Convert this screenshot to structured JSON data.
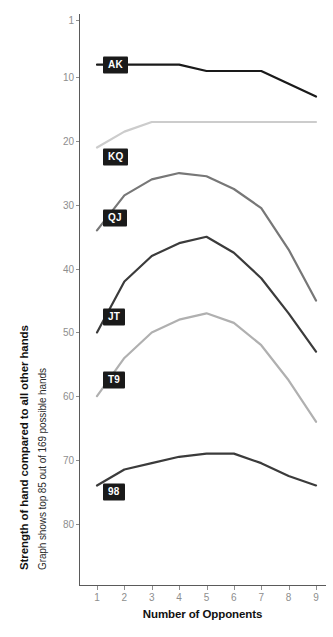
{
  "chart_data": {
    "type": "line",
    "title": "",
    "ylabel": "Strength of hand compared to all other hands",
    "ylabel_sub": "Graph shows top 85 out of 169 possible hands",
    "xlabel": "Number of Opponents",
    "x": [
      1,
      2,
      3,
      4,
      5,
      6,
      7,
      8,
      9
    ],
    "xticklabels": [
      "1",
      "2",
      "3",
      "4",
      "5",
      "6",
      "7",
      "8",
      "9"
    ],
    "yticklabels": [
      "1",
      "10",
      "20",
      "30",
      "40",
      "50",
      "60",
      "70",
      "80"
    ],
    "yticks": [
      1,
      10,
      20,
      30,
      40,
      50,
      60,
      70,
      80
    ],
    "ylim": [
      1,
      86
    ],
    "xlim": [
      1,
      9
    ],
    "y_inverted": true,
    "grid": false,
    "legend": "inline-flag-labels",
    "series": [
      {
        "name": "AK",
        "label": "AK",
        "color": "#1a1a1a",
        "width": 2.2,
        "values": [
          8,
          8,
          8,
          8,
          9,
          9,
          9,
          11,
          13
        ],
        "label_x": 1,
        "label_y": 8
      },
      {
        "name": "KQ",
        "label": "KQ",
        "color": "#cccccc",
        "width": 2.2,
        "values": [
          21,
          18.5,
          17,
          17,
          17,
          17,
          17,
          17,
          17
        ],
        "label_x": 1,
        "label_y": 22.5
      },
      {
        "name": "QJ",
        "label": "QJ",
        "color": "#777777",
        "width": 2.2,
        "values": [
          34,
          28.5,
          26,
          25,
          25.5,
          27.5,
          30.5,
          37,
          45
        ],
        "label_x": 1,
        "label_y": 32
      },
      {
        "name": "JT",
        "label": "JT",
        "color": "#3b3b3b",
        "width": 2.2,
        "values": [
          50,
          42,
          38,
          36,
          35,
          37.5,
          41.5,
          47,
          53
        ],
        "label_x": 1,
        "label_y": 47.5
      },
      {
        "name": "T9",
        "label": "T9",
        "color": "#b0b0b0",
        "width": 2.2,
        "values": [
          60,
          54,
          50,
          48,
          47,
          48.5,
          52,
          57.5,
          64
        ],
        "label_x": 1,
        "label_y": 57.5
      },
      {
        "name": "98",
        "label": "98",
        "color": "#3b3b3b",
        "width": 2.2,
        "values": [
          74,
          71.5,
          70.5,
          69.5,
          69,
          69,
          70.5,
          72.5,
          74
        ],
        "label_x": 1,
        "label_y": 75
      }
    ]
  },
  "axis_colors": {
    "axis_line": "#5a5a5a",
    "tick_text": "#8e8e8e",
    "title_text": "#111111",
    "flag_bg": "#1a1a1a",
    "flag_text": "#ffffff"
  }
}
